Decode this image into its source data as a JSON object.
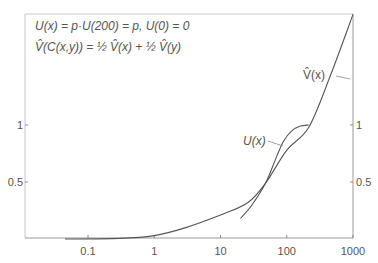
{
  "chart_data": {
    "type": "line",
    "title": "",
    "xlabel": "",
    "ylabel": "",
    "xscale": "log",
    "xlim": [
      0.01,
      1000
    ],
    "ylim": [
      0,
      1.97
    ],
    "grid": false,
    "x_ticks": [
      {
        "value": 0.1,
        "label": "0.1"
      },
      {
        "value": 1,
        "label": "1"
      },
      {
        "value": 10,
        "label": "10"
      },
      {
        "value": 100,
        "label": "100"
      },
      {
        "value": 1000,
        "label": "1000"
      }
    ],
    "y_ticks": [
      {
        "value": 1,
        "label": "1"
      },
      {
        "value": 0.5,
        "label": "0.5"
      }
    ],
    "annotations": [
      "U(x) = p·U(200) = p, U(0) = 0",
      "V̂(C(x,y)) = ½ V̂(x) + ½ V̂(y)"
    ],
    "series": [
      {
        "name": "V̂(x)",
        "label": "V̂(x)",
        "points": [
          [
            0.045,
            0.0
          ],
          [
            0.3,
            0.005
          ],
          [
            1,
            0.03
          ],
          [
            3,
            0.1
          ],
          [
            10,
            0.21
          ],
          [
            26,
            0.32
          ],
          [
            48,
            0.49
          ],
          [
            100,
            0.78
          ],
          [
            215,
            0.98
          ],
          [
            460,
            1.44
          ],
          [
            1000,
            1.97
          ]
        ]
      },
      {
        "name": "U(x)",
        "label": "U(x)",
        "points": [
          [
            20,
            0.18
          ],
          [
            30,
            0.3
          ],
          [
            48,
            0.49
          ],
          [
            70,
            0.72
          ],
          [
            90,
            0.86
          ],
          [
            120,
            0.95
          ],
          [
            160,
            0.99
          ],
          [
            215,
            1.0
          ]
        ]
      }
    ]
  }
}
